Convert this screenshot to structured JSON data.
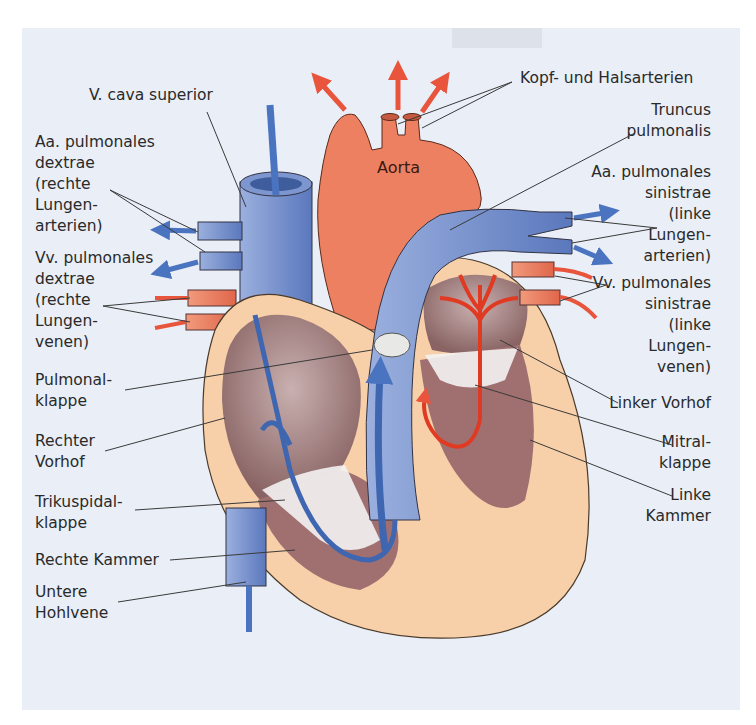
{
  "figure": {
    "colors": {
      "background": "#e9eef7",
      "arterial_red": "#e8553c",
      "aorta_orange": "#ee8062",
      "venous_blue": "#4a74c0",
      "vessel_blue": "#7d96cf",
      "myocardium": "#f7cfa8",
      "chamber_inner": "#a88484",
      "leader_line": "#3a3a3a"
    }
  },
  "labels": {
    "aorta": "Aorta",
    "left": [
      {
        "id": "v-cava-superior",
        "text": "V. cava superior"
      },
      {
        "id": "aa-pulmonales-dextrae",
        "text": "Aa. pulmonales\ndextrae\n(rechte\nLungen-\narterien)"
      },
      {
        "id": "vv-pulmonales-dextrae",
        "text": "Vv. pulmonales\ndextrae\n(rechte\nLungen-\nvenen)"
      },
      {
        "id": "pulmonalklappe",
        "text": "Pulmonal-\nklappe"
      },
      {
        "id": "rechter-vorhof",
        "text": "Rechter\nVorhof"
      },
      {
        "id": "trikuspidalklappe",
        "text": "Trikuspidal-\nklappe"
      },
      {
        "id": "rechte-kammer",
        "text": "Rechte Kammer"
      },
      {
        "id": "untere-hohlvene",
        "text": "Untere\nHohlvene"
      }
    ],
    "right": [
      {
        "id": "kopf-halsarterien",
        "text": "Kopf- und Halsarterien"
      },
      {
        "id": "truncus-pulmonalis",
        "text": "Truncus\npulmonalis"
      },
      {
        "id": "aa-pulmonales-sinistrae",
        "text": "Aa. pulmonales\nsinistrae\n(linke\nLungen-\narterien)"
      },
      {
        "id": "vv-pulmonales-sinistrae",
        "text": "Vv. pulmonales\nsinistrae\n(linke\nLungen-\nvenen)"
      },
      {
        "id": "linker-vorhof",
        "text": "Linker Vorhof"
      },
      {
        "id": "mitralklappe",
        "text": "Mitral-\nklappe"
      },
      {
        "id": "linke-kammer",
        "text": "Linke\nKammer"
      }
    ]
  }
}
